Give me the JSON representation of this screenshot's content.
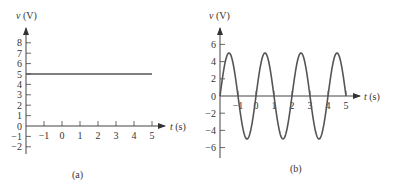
{
  "chart_data": [
    {
      "type": "line",
      "panel_label": "(a)",
      "title": "",
      "xlabel": "t (s)",
      "ylabel": "v (V)",
      "x_ticks": [
        -1,
        0,
        1,
        2,
        3,
        4,
        5
      ],
      "y_ticks": [
        -2,
        -1,
        0,
        1,
        2,
        3,
        4,
        5,
        6,
        7,
        8
      ],
      "xlim": [
        -2,
        5.5
      ],
      "ylim": [
        -3,
        9
      ],
      "grid": false,
      "series": [
        {
          "name": "v(t) = 5",
          "x": [
            -2,
            5
          ],
          "y": [
            5,
            5
          ]
        }
      ]
    },
    {
      "type": "line",
      "panel_label": "(b)",
      "title": "",
      "xlabel": "t (s)",
      "ylabel": "v (V)",
      "x_ticks": [
        -1,
        0,
        1,
        2,
        3,
        4,
        5
      ],
      "y_ticks": [
        -6,
        -4,
        -2,
        0,
        2,
        4,
        6
      ],
      "xlim": [
        -2,
        5.5
      ],
      "ylim": [
        -7,
        7
      ],
      "grid": false,
      "series": [
        {
          "name": "v(t) = 5 sin(πt)",
          "amplitude": 5,
          "period": 2,
          "x_range": [
            -2,
            5
          ],
          "x": [
            -2,
            -1.5,
            -1,
            -0.5,
            0,
            0.5,
            1,
            1.5,
            2,
            2.5,
            3,
            3.5,
            4,
            4.5,
            5
          ],
          "y": [
            0,
            5,
            0,
            -5,
            0,
            5,
            0,
            -5,
            0,
            5,
            0,
            -5,
            0,
            5,
            0
          ]
        }
      ]
    }
  ],
  "labels": {
    "a": {
      "ylabel_var": "v",
      "ylabel_unit": " (V)",
      "xlabel_var": "t",
      "xlabel_unit": " (s)",
      "caption": "(a)"
    },
    "b": {
      "ylabel_var": "v",
      "ylabel_unit": " (V)",
      "xlabel_var": "t",
      "xlabel_unit": " (s)",
      "caption": "(b)"
    }
  },
  "colors": {
    "axis": "#444444",
    "curve": "#555555",
    "text": "#333333"
  }
}
